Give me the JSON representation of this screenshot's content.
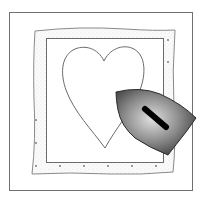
{
  "illustration": {
    "subject": "Ironing a heart appliqué onto a quilt block",
    "elements": [
      "outer-frame",
      "fabric-block",
      "inner-square",
      "heart-appliqué",
      "iron"
    ]
  },
  "colors": {
    "background": "#ffffff",
    "outline": "#6a6a6a",
    "fabric_fill": "#f4f4f4",
    "dots": "#707070",
    "iron_dark": "#2a2a2a",
    "iron_light": "#d8d8d8",
    "handle": "#000000"
  }
}
